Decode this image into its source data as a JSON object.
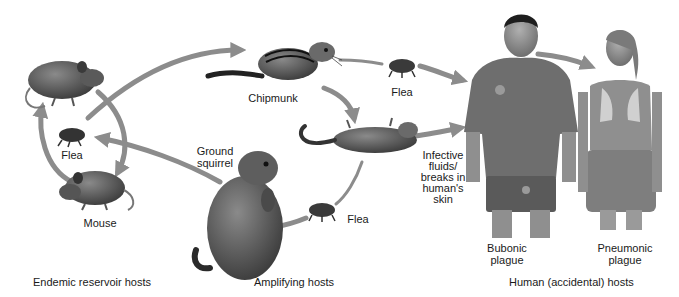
{
  "diagram": {
    "colors": {
      "arrow": "#8c8c8c",
      "animal": "#4a4a4a",
      "animal_light": "#7a7a7a",
      "human_skin": "#8f8f8f",
      "sweater": "#6e6e6e",
      "background": "#ffffff"
    },
    "nodes": {
      "rat_top": {
        "label": ""
      },
      "flea_reservoir": {
        "label": "Flea"
      },
      "mouse": {
        "label": "Mouse"
      },
      "chipmunk": {
        "label": "Chipmunk"
      },
      "flea_top": {
        "label": "Flea"
      },
      "dead_rodent": {
        "label": ""
      },
      "ground_squirrel": {
        "label": "Ground\nsquirrel"
      },
      "flea_bottom": {
        "label": "Flea"
      },
      "infective_note": {
        "label": "Infective\nfluids/\nbreaks in\nhuman's\nskin"
      },
      "man": {
        "label": "Bubonic\nplague"
      },
      "woman": {
        "label": "Pneumonic\nplague"
      }
    },
    "groups": [
      {
        "label": "Endemic reservoir hosts"
      },
      {
        "label": "Amplifying hosts"
      },
      {
        "label": "Human (accidental) hosts"
      }
    ]
  }
}
